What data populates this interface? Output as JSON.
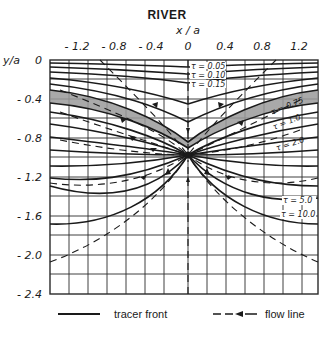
{
  "diagram": {
    "title": "RIVER",
    "x_axis": {
      "label": "x / a",
      "ticks": [
        "- 1.2",
        "- 0.8",
        "- 0.4",
        "0",
        "0.4",
        "0.8",
        "1.2"
      ]
    },
    "y_axis": {
      "label": "y/a",
      "ticks": [
        "0",
        "- 0.4",
        "- 0.8",
        "- 1.2",
        "- 1.6",
        "- 2.0",
        "- 2.4"
      ]
    },
    "tracer_front_labels": [
      "τ = 0.05",
      "τ = 0.10",
      "τ = 0.15",
      "τ = 0.75",
      "τ = 1.0",
      "τ = 2.0",
      "τ = 5.0",
      "τ = 10.0"
    ],
    "well_position": {
      "x_over_a": 0,
      "y_over_a": -1.0
    },
    "shaded_band": "between τ = 0.15 and τ = 0.75 fronts",
    "legend": [
      {
        "symbol": "solid-line",
        "label": "tracer front"
      },
      {
        "symbol": "dashed-arrow-line",
        "label": "flow line"
      }
    ],
    "colors": {
      "ink": "#1a1a1a",
      "grid": "#2a2a2a",
      "shade": "#9a9a9a",
      "background": "#ffffff"
    }
  }
}
